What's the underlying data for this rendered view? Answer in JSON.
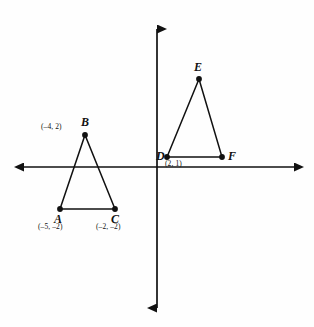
{
  "figure": {
    "width": 314,
    "height": 327,
    "background": "#fefefe",
    "ink_color": "#111111"
  },
  "axes": {
    "origin_px": {
      "x": 157,
      "y": 167
    },
    "units_per_pixel": 18.5,
    "x_axis": {
      "start_px": 12,
      "end_px": 305,
      "arrows": "both"
    },
    "y_axis": {
      "start_px": 17,
      "end_px": 320,
      "arrows": "both"
    },
    "gridlines": false,
    "tick_labels": []
  },
  "shapes": [
    {
      "name": "triangle-abc",
      "vertices": [
        {
          "id": "A",
          "label": "A",
          "coord_label": "(–5, –2)",
          "x": -5,
          "y": -2,
          "px": {
            "x": 60,
            "y": 209
          }
        },
        {
          "id": "B",
          "label": "B",
          "coord_label": "(–4, 2)",
          "x": -4,
          "y": 2,
          "px": {
            "x": 85,
            "y": 135
          }
        },
        {
          "id": "C",
          "label": "C",
          "coord_label": "(–2, –2)",
          "x": -2,
          "y": -2,
          "px": {
            "x": 115,
            "y": 209
          }
        }
      ]
    },
    {
      "name": "triangle-def",
      "vertices": [
        {
          "id": "D",
          "label": "D",
          "coord_label": "(2, 1)",
          "x": 2,
          "y": 1,
          "px": {
            "x": 167,
            "y": 157
          }
        },
        {
          "id": "E",
          "label": "E",
          "coord_label": "",
          "x": 2,
          "y": 5,
          "px": {
            "x": 199,
            "y": 79
          }
        },
        {
          "id": "F",
          "label": "F",
          "coord_label": "",
          "x": 5,
          "y": 1,
          "px": {
            "x": 222,
            "y": 157
          }
        }
      ]
    }
  ],
  "labels": {
    "a_name": "A",
    "a_coord": "(–5, –2)",
    "b_name": "B",
    "b_coord": "(–4, 2)",
    "c_name": "C",
    "c_coord": "(–2, –2)",
    "d_name": "D",
    "d_coord": "(2, 1)",
    "e_name": "E",
    "f_name": "F"
  }
}
